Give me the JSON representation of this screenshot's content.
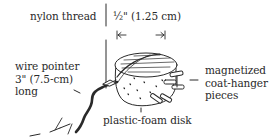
{
  "diagram": {
    "colors": {
      "ink": "#2a2a2a",
      "background": "#ffffff"
    },
    "labels": {
      "thread": "nylon thread",
      "dimension": "½\" (1.25 cm)",
      "pointer": [
        "wire pointer",
        "3\" (7.5-cm)",
        "long"
      ],
      "pieces": [
        "magnetized",
        "coat-hanger",
        "pieces"
      ],
      "disk": "plastic-foam disk"
    },
    "dimension_arrows": {
      "left": "|←",
      "right": "→|"
    }
  }
}
